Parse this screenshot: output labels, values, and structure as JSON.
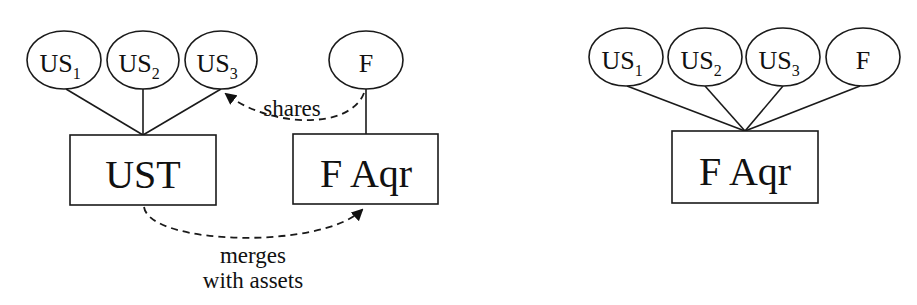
{
  "left_diagram": {
    "shareholders": [
      {
        "id": "US",
        "sub": "1"
      },
      {
        "id": "US",
        "sub": "2"
      },
      {
        "id": "US",
        "sub": "3"
      }
    ],
    "acquirer_shareholder": {
      "id": "F"
    },
    "target_box": {
      "label": "UST"
    },
    "acquirer_box": {
      "label": "F Aqr"
    },
    "arrows": {
      "shares": "shares",
      "merges_line1": "merges",
      "merges_line2": "with assets"
    }
  },
  "right_diagram": {
    "shareholders": [
      {
        "id": "US",
        "sub": "1"
      },
      {
        "id": "US",
        "sub": "2"
      },
      {
        "id": "US",
        "sub": "3"
      },
      {
        "id": "F",
        "sub": ""
      }
    ],
    "acquirer_box": {
      "label": "F Aqr"
    }
  },
  "colors": {
    "stroke": "#1a1a1a",
    "background": "#ffffff"
  }
}
